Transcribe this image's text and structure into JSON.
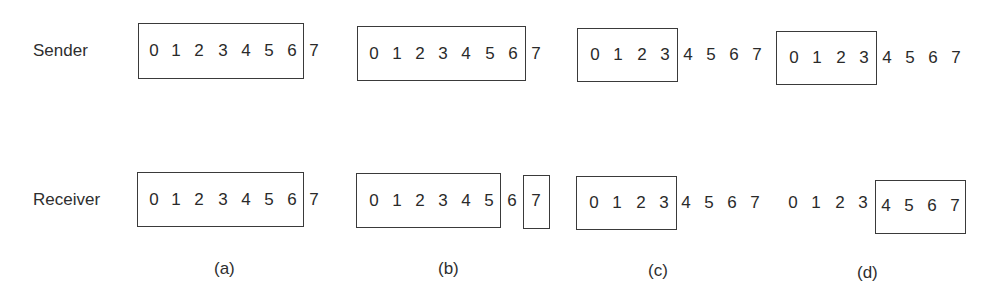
{
  "diagram": {
    "type": "sliding-window-protocol",
    "rows": {
      "sender": {
        "label": "Sender"
      },
      "receiver": {
        "label": "Receiver"
      }
    },
    "sequence_numbers": [
      "0",
      "1",
      "2",
      "3",
      "4",
      "5",
      "6",
      "7"
    ],
    "panels": [
      {
        "caption": "(a)",
        "sender": {
          "window": [
            "0",
            "1",
            "2",
            "3",
            "4",
            "5",
            "6"
          ],
          "outside": [
            "7"
          ]
        },
        "receiver": {
          "window": [
            "0",
            "1",
            "2",
            "3",
            "4",
            "5",
            "6"
          ],
          "outside": [
            "7"
          ]
        }
      },
      {
        "caption": "(b)",
        "sender": {
          "window": [
            "0",
            "1",
            "2",
            "3",
            "4",
            "5",
            "6"
          ],
          "outside": [
            "7"
          ]
        },
        "receiver": {
          "window": [
            "0",
            "1",
            "2",
            "3",
            "4",
            "5"
          ],
          "between": [
            "6"
          ],
          "second_window": [
            "7"
          ]
        }
      },
      {
        "caption": "(c)",
        "sender": {
          "window": [
            "0",
            "1",
            "2",
            "3"
          ],
          "outside": [
            "4",
            "5",
            "6",
            "7"
          ]
        },
        "receiver": {
          "window": [
            "0",
            "1",
            "2",
            "3"
          ],
          "outside": [
            "4",
            "5",
            "6",
            "7"
          ]
        }
      },
      {
        "caption": "(d)",
        "sender": {
          "window": [
            "0",
            "1",
            "2",
            "3"
          ],
          "outside": [
            "4",
            "5",
            "6",
            "7"
          ]
        },
        "receiver": {
          "before": [
            "0",
            "1",
            "2",
            "3"
          ],
          "window": [
            "4",
            "5",
            "6",
            "7"
          ]
        }
      }
    ],
    "colors": {
      "background": "#ffffff",
      "ink": "#2a2a2a",
      "box_border": "#3a3a3a"
    }
  }
}
